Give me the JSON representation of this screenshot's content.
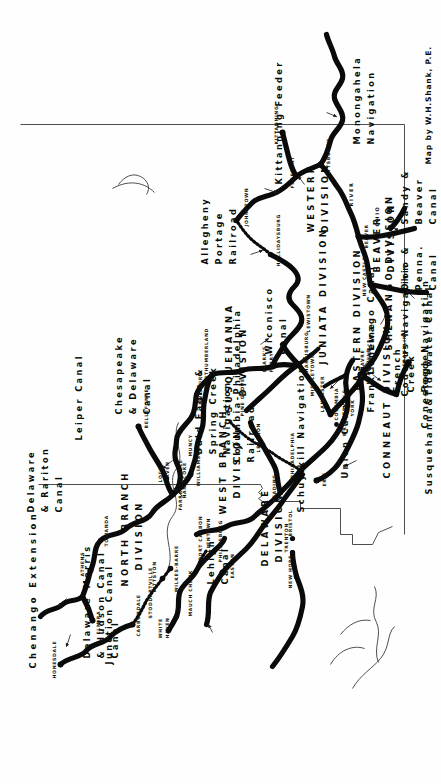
{
  "map": {
    "title": "Pennsylvania Canals",
    "credit": "Map by W.H.Shank, P.E.",
    "orientation_deg": -90,
    "ink_color": "#0a0a0a",
    "paper_color": "#fefefe"
  },
  "divisions": [
    {
      "name": "NORTH BRANCH DIVISION",
      "lines": [
        "NORTH BRANCH",
        "DIVISION"
      ]
    },
    {
      "name": "WEST BRANCH DIVISION",
      "lines": [
        "WEST BRANCH",
        "DIVISION"
      ]
    },
    {
      "name": "SUSQUEHANNA DIVISION",
      "lines": [
        "SUSQUEHANNA",
        "DIVISION"
      ]
    },
    {
      "name": "JUNIATA DIVISION",
      "lines": [
        "JUNIATA DIVISION"
      ]
    },
    {
      "name": "EASTERN DIVISION",
      "lines": [
        "EASTERN DIVISION"
      ]
    },
    {
      "name": "WESTERN DIVISION",
      "lines": [
        "WESTERN",
        "DIVISION"
      ]
    },
    {
      "name": "DELAWARE DIVISION",
      "lines": [
        "DELAWARE",
        "DIVISION"
      ]
    },
    {
      "name": "CONNEAUT DIVISION",
      "lines": [
        "CONNEAUT DIVISION"
      ]
    },
    {
      "name": "SHENANGO DIVISION",
      "lines": [
        "SHENANGO DIVISION"
      ]
    },
    {
      "name": "BEAVER DIVISION",
      "lines": [
        "BEAVER",
        "DIVISION"
      ]
    }
  ],
  "canals": [
    {
      "name": "Chenango Extension",
      "lines": [
        "Chenango Extension"
      ]
    },
    {
      "name": "Junction Canal",
      "lines": [
        "Junction Canal"
      ]
    },
    {
      "name": "Delaware & Hudson Canal",
      "lines": [
        "Delaware",
        "& Hudson",
        "Canal"
      ]
    },
    {
      "name": "Morris Canal",
      "lines": [
        "Morris",
        "Canal"
      ]
    },
    {
      "name": "Delaware & Raritan Canal",
      "lines": [
        "Delaware",
        "& Rariton",
        "Canal"
      ]
    },
    {
      "name": "Lehigh Canal",
      "lines": [
        "Lehigh",
        "Canal"
      ]
    },
    {
      "name": "Leiper Canal",
      "lines": [
        "Leiper Canal"
      ]
    },
    {
      "name": "Chesapeake & Delaware Canal",
      "lines": [
        "Chesapeake",
        "& Delaware",
        "Canal"
      ]
    },
    {
      "name": "Schuylkill Navigation",
      "lines": [
        "Schuylkill Navigation"
      ]
    },
    {
      "name": "Union Canal",
      "lines": [
        "Union Canal"
      ]
    },
    {
      "name": "Columbia-Philadelphia Railroad",
      "lines": [
        "Columbia-Philadelphia",
        "Railroad"
      ]
    },
    {
      "name": "Conewago Canal",
      "lines": [
        "Conewago Canal"
      ]
    },
    {
      "name": "Codorus Navigation",
      "lines": [
        "Codorus Navigation"
      ]
    },
    {
      "name": "Conestoga Navigation",
      "lines": [
        "Conestoga Navigation"
      ]
    },
    {
      "name": "Susquehanna & Tidewater Canal",
      "lines": [
        "Susquehanna&Tidewater Canal"
      ]
    },
    {
      "name": "Wiconisco Canal",
      "lines": [
        "Wiconisco",
        "Canal"
      ]
    },
    {
      "name": "Bald Eagle & Spring Creek Navigation",
      "lines": [
        "Bald Eagle &",
        "Spring Creek",
        "Navigation"
      ]
    },
    {
      "name": "Allegheny Portage Railroad",
      "lines": [
        "Allegheny",
        "Portage",
        "Railroad"
      ]
    },
    {
      "name": "Kittanning Feeder",
      "lines": [
        "Kittanning Feeder"
      ]
    },
    {
      "name": "Monongahela Navigation",
      "lines": [
        "Monongahela",
        "Navigation"
      ]
    },
    {
      "name": "French Creek Feeder",
      "lines": [
        "French",
        "Creek",
        "Feeder"
      ]
    },
    {
      "name": "Franklin Line",
      "lines": [
        "Franklin Line"
      ]
    },
    {
      "name": "Ohio & Penna. Canal",
      "lines": [
        "Ohio &",
        "Penna.",
        "Canal"
      ]
    },
    {
      "name": "Sandy & Beaver Canal",
      "lines": [
        "Sandy &",
        "Beaver",
        "Canal"
      ]
    }
  ],
  "cities": [
    {
      "name": "ELMIRA"
    },
    {
      "name": "ATHENS"
    },
    {
      "name": "TOWANDA"
    },
    {
      "name": "HONESDALE"
    },
    {
      "name": "CARBONDALE"
    },
    {
      "name": "PITTSTON"
    },
    {
      "name": "WILKES-BARRE"
    },
    {
      "name": "STODDARTVILLE"
    },
    {
      "name": "WHITE HAVEN"
    },
    {
      "name": "MAUCH CHUNK"
    },
    {
      "name": "PORT CARBON"
    },
    {
      "name": "EASTON"
    },
    {
      "name": "PHILIPSBURG"
    },
    {
      "name": "ALLENTOWN"
    },
    {
      "name": "NEW HOPE"
    },
    {
      "name": "TRENTON"
    },
    {
      "name": "BRISTOL"
    },
    {
      "name": "PHILADELPHIA"
    },
    {
      "name": "READING"
    },
    {
      "name": "LEBANON"
    },
    {
      "name": "MIDDLETOWN"
    },
    {
      "name": "LANCASTER"
    },
    {
      "name": "COLUMBIA"
    },
    {
      "name": "WRIGHTSVILLE"
    },
    {
      "name": "YORK"
    },
    {
      "name": "HAVRE DE GRACE"
    },
    {
      "name": "HARRISBURG"
    },
    {
      "name": "CLARK'S FERRY"
    },
    {
      "name": "PINE GROVE"
    },
    {
      "name": "NORTHUMBERLAND"
    },
    {
      "name": "NANTICOKE"
    },
    {
      "name": "MUNCY"
    },
    {
      "name": "WILLIAMSPORT"
    },
    {
      "name": "LOCK HAVEN"
    },
    {
      "name": "FARRANDSVILLE"
    },
    {
      "name": "BELLEFONTE"
    },
    {
      "name": "LEWISBURG"
    },
    {
      "name": "LEWISTOWN"
    },
    {
      "name": "HOLLIDAYSBURG"
    },
    {
      "name": "JOHNSTOWN"
    },
    {
      "name": "PITTSBURGH"
    },
    {
      "name": "FREEPORT"
    },
    {
      "name": "KITTANNING"
    },
    {
      "name": "BEAVER"
    },
    {
      "name": "NEW CASTLE"
    },
    {
      "name": "FRANKLIN"
    },
    {
      "name": "MEADVILLE"
    },
    {
      "name": "ERIE"
    }
  ],
  "rivers": [
    {
      "name": "OHIO"
    },
    {
      "name": "RIVER"
    }
  ],
  "labels": {
    "chenango_extension": "Chenango Extension",
    "junction_canal": "Junction Canal",
    "north_branch": "NORTH BRANCH",
    "north_branch_2": "DIVISION",
    "west_branch": "WEST BRANCH",
    "west_branch_2": "DIVISION",
    "susquehanna": "SUSQUEHANNA",
    "susquehanna_2": "DIVISION",
    "juniata": "JUNIATA DIVISION",
    "eastern": "EASTERN DIVISION",
    "western": "WESTERN",
    "western_2": "DIVISION",
    "delaware_div": "DELAWARE",
    "delaware_div_2": "DIVISION",
    "conneaut": "CONNEAUT DIVISION",
    "shenango": "SHENANGO DIVISION",
    "beaver_div": "BEAVER",
    "beaver_div_2": "DIVISION",
    "dh_1": "Delaware",
    "dh_2": "& Hudson",
    "dh_3": "Canal",
    "morris_1": "Morris",
    "morris_2": "Canal",
    "dr_1": "Delaware",
    "dr_2": "& Rariton",
    "dr_3": "Canal",
    "lehigh_1": "Lehigh",
    "lehigh_2": "Canal",
    "leiper": "Leiper Canal",
    "cd_1": "Chesapeake",
    "cd_2": "& Delaware",
    "cd_3": "Canal",
    "schuylkill": "Schuylkill Navigation",
    "union": "Union Canal",
    "colphil_1": "Columbia-Philadelphia",
    "colphil_2": "Railroad",
    "conewago": "Conewago Canal",
    "codorus": "Codorus Navigation",
    "conestoga": "Conestoga Navigation",
    "susq_tide": "Susquehanna&Tidewater Canal",
    "wiconisco_1": "Wiconisco",
    "wiconisco_2": "Canal",
    "baldeagle_1": "Bald Eagle &",
    "baldeagle_2": "Spring Creek",
    "baldeagle_3": "Navigation",
    "portage_1": "Allegheny",
    "portage_2": "Portage",
    "portage_3": "Railroad",
    "kittanning_feeder": "Kittanning Feeder",
    "monongahela_1": "Monongahela",
    "monongahela_2": "Navigation",
    "french_1": "French",
    "french_2": "Creek",
    "french_3": "Feeder",
    "franklin_line": "Franklin Line",
    "ohiopenna_1": "Ohio &",
    "ohiopenna_2": "Penna.",
    "ohiopenna_3": "Canal",
    "sandybeaver_1": "Sandy &",
    "sandybeaver_2": "Beaver",
    "sandybeaver_3": "Canal",
    "credit": "Map by W.H.Shank, P.E.",
    "city_elmira": "ELMIRA",
    "city_athens": "ATHENS",
    "city_towanda": "TOWANDA",
    "city_honesdale": "HONESDALE",
    "city_carbondale": "CARBONDALE",
    "city_pittston": "PITTSTON",
    "city_wilkesbarre": "WILKES-BARRE",
    "city_stoddartville": "STODDARTVILLE",
    "city_whitehaven_1": "WHITE",
    "city_whitehaven_2": "HAVEN",
    "city_mauchchunk": "MAUCH CHUNK",
    "city_portcarbon": "PORT CARBON",
    "city_easton": "EASTON",
    "city_philipsburg": "PHILIPSBURG",
    "city_allentown": "ALLENTOWN",
    "city_newhope": "NEW HOPE",
    "city_trenton": "TRENTON",
    "city_bristol": "BRISTOL",
    "city_philadelphia": "PHILADELPHIA",
    "city_reading": "READING",
    "city_lebanon": "LEBANON",
    "city_middletown": "MIDDLETOWN",
    "city_lancaster": "LANCASTER",
    "city_columbia": "COLUMBIA",
    "city_wrightsville": "WRIGHTSVILLE",
    "city_york": "YORK",
    "city_havre_1": "HAVRE",
    "city_havre_2": "DE GRACE",
    "city_harrisburg": "HARRISBURG",
    "city_clarksferry_1": "CLARK'S",
    "city_clarksferry_2": "FERRY",
    "city_pinegrove": "PINE GROVE",
    "city_northumberland": "NORTHUMBERLAND",
    "city_nanticoke": "NANTICOKE",
    "city_muncy": "MUNCY",
    "city_williamsport": "WILLIAMSPORT",
    "city_lockhaven_1": "LOCK",
    "city_lockhaven_2": "HAVEN",
    "city_farrandsville": "FARRANDSVILLE",
    "city_bellefonte": "BELLEFONTE",
    "city_lewisburg": "LEWISBURG",
    "city_lewistown": "LEWISTOWN",
    "city_hollidaysburg": "HOLLIDAYSBURG",
    "city_johnstown": "JOHNSTOWN",
    "city_pittsburgh": "PITTSBURGH",
    "city_freeport": "FREEPORT",
    "city_kittanning": "KITTANNING",
    "city_beaver": "BEAVER",
    "city_newcastle": "NEW CASTLE",
    "city_franklin": "FRANKLIN",
    "city_meadville": "MEADVILLE",
    "city_erie": "ERIE",
    "river_ohio": "OHIO",
    "river_river": "RIVER"
  }
}
